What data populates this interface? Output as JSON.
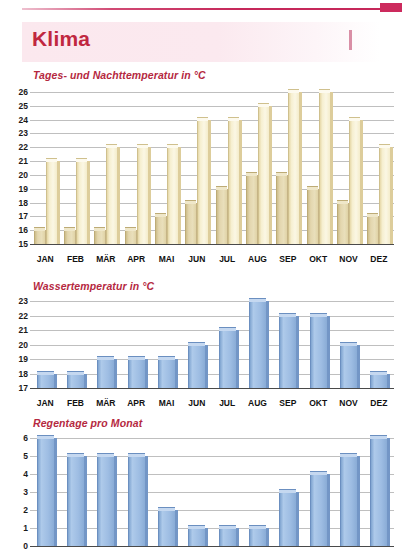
{
  "header": {
    "title": "Klima",
    "corner_tab_color": "#cc2a5d",
    "band_color": "#fbe8ee",
    "title_color": "#c0273f"
  },
  "months": [
    "JAN",
    "FEB",
    "MÄR",
    "APR",
    "MAI",
    "JUN",
    "JUL",
    "AUG",
    "SEP",
    "OKT",
    "NOV",
    "DEZ"
  ],
  "sections": [
    {
      "title": "Tages- und Nachttemperatur in °C"
    },
    {
      "title": "Wassertemperatur in °C"
    },
    {
      "title": "Regentage pro Monat"
    }
  ],
  "chart_data": [
    {
      "type": "bar",
      "title": "Tages- und Nachttemperatur in °C",
      "xlabel": "",
      "ylabel": "°C",
      "ylim": [
        15,
        26
      ],
      "yticks": [
        15,
        16,
        17,
        18,
        19,
        20,
        21,
        22,
        23,
        24,
        25,
        26
      ],
      "grid": true,
      "legend": "none",
      "categories": [
        "JAN",
        "FEB",
        "MÄR",
        "APR",
        "MAI",
        "JUN",
        "JUL",
        "AUG",
        "SEP",
        "OKT",
        "NOV",
        "DEZ"
      ],
      "series": [
        {
          "name": "Nachttemperatur",
          "color": "#ddcf9f",
          "values": [
            16,
            16,
            16,
            16,
            17,
            18,
            19,
            20,
            20,
            19,
            18,
            17
          ]
        },
        {
          "name": "Tagestemperatur",
          "color": "#fbf7e4",
          "values": [
            21,
            21,
            22,
            22,
            22,
            24,
            24,
            25,
            26,
            26,
            24,
            22
          ]
        }
      ]
    },
    {
      "type": "bar",
      "title": "Wassertemperatur in °C",
      "xlabel": "",
      "ylabel": "°C",
      "ylim": [
        17,
        23
      ],
      "yticks": [
        17,
        18,
        19,
        20,
        21,
        22,
        23
      ],
      "grid": true,
      "legend": "none",
      "categories": [
        "JAN",
        "FEB",
        "MÄR",
        "APR",
        "MAI",
        "JUN",
        "JUL",
        "AUG",
        "SEP",
        "OKT",
        "NOV",
        "DEZ"
      ],
      "series": [
        {
          "name": "Wassertemperatur",
          "color": "#9ebde3",
          "values": [
            18,
            18,
            19,
            19,
            19,
            20,
            21,
            23,
            22,
            22,
            20,
            18
          ]
        }
      ]
    },
    {
      "type": "bar",
      "title": "Regentage pro Monat",
      "xlabel": "",
      "ylabel": "Tage",
      "ylim": [
        0,
        6
      ],
      "yticks": [
        0,
        1,
        2,
        3,
        4,
        5,
        6
      ],
      "grid": true,
      "legend": "none",
      "categories": [
        "JAN",
        "FEB",
        "MÄR",
        "APR",
        "MAI",
        "JUN",
        "JUL",
        "AUG",
        "SEP",
        "OKT",
        "NOV",
        "DEZ"
      ],
      "series": [
        {
          "name": "Regentage",
          "color": "#9ebde3",
          "values": [
            6,
            5,
            5,
            5,
            2,
            1,
            1,
            1,
            3,
            4,
            5,
            6
          ]
        }
      ]
    }
  ]
}
